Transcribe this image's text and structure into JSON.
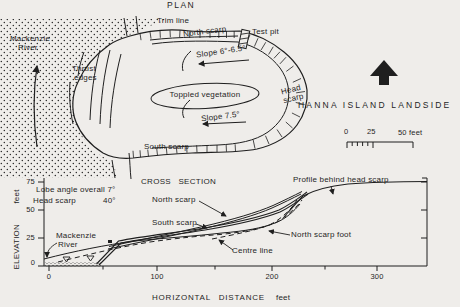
{
  "plan": {
    "title": "PLAN",
    "trim_line_label": "Trim line",
    "north_scarp_label": "North scarp",
    "test_pit_label": "Test pit",
    "river_line1": "Mackenzie",
    "river_line2": "River",
    "thrust_line1": "Thrust",
    "thrust_line2": "edges",
    "slope_upper_label": "Slope 6°-6.5°",
    "toppled_vegetation_label": "Toppled vegetation",
    "slope_lower_label": "Slope 7.5°",
    "head_scarp_line1": "Head",
    "head_scarp_line2": "scarp",
    "south_scarp_label": "South scarp",
    "caption": "HANNA ISLAND LANDSIDE",
    "scale_bar": {
      "zero": "0",
      "mid": "25",
      "end": "50 feet"
    }
  },
  "cross_section": {
    "title": "CROSS SECTION",
    "note_line1": "Lobe angle overall 7°",
    "note2_label": "Head scarp",
    "note2_value": "40°",
    "north_scarp_label": "North scarp",
    "south_scarp_label": "South scarp",
    "centre_line_label": "Centre line",
    "north_scarp_foot_label": "North scarp foot",
    "profile_label": "Profile behind head scarp",
    "river_line1": "Mackenzie",
    "river_line2": "River",
    "y_axis": {
      "unit": "feet",
      "label": "ELEVATION",
      "ticks": [
        "75",
        "50",
        "25",
        "0"
      ]
    },
    "x_axis": {
      "label": "HORIZONTAL DISTANCE",
      "unit": "feet",
      "ticks": [
        "0",
        "100",
        "200",
        "300"
      ]
    }
  },
  "colors": {
    "ink": "#1f1f1f",
    "paper": "#efedea"
  }
}
